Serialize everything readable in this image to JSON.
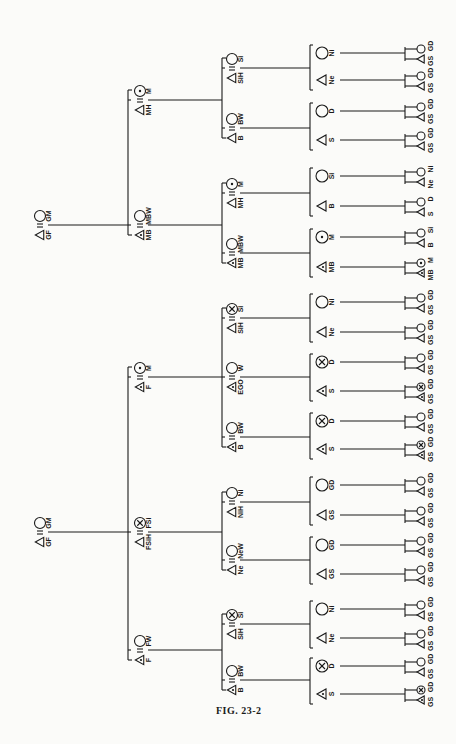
{
  "figure": {
    "caption": "FIG. 23-2",
    "orientation": "rotated 90° (generations run left to right, labels read bottom-to-top)"
  },
  "symbols": {
    "male": "triangle",
    "female": "circle",
    "marriage": "double-line (=)",
    "ego_related_marked": "circle/triangle with dot",
    "crossed": "circle with x"
  },
  "tree": {
    "level0": [
      {
        "id": "top-grandparents",
        "male": "GF",
        "female": "GM",
        "y": 225
      },
      {
        "id": "bottom-grandparents",
        "male": "GF",
        "female": "GM",
        "y": 532
      }
    ],
    "level1": [
      {
        "male": "MH",
        "female": "M",
        "female_mark": "dot",
        "y": 100
      },
      {
        "male": "MB",
        "female": "MBW",
        "male_mark": "dot",
        "y": 225
      },
      {
        "male": "F",
        "female": "M",
        "female_mark": "dot",
        "male_mark": "dot",
        "y": 377
      },
      {
        "male": "FSiH",
        "female": "FSi",
        "female_mark": "x",
        "y": 532
      },
      {
        "male": "F",
        "female": "FW",
        "male_mark": "dot",
        "y": 650
      }
    ],
    "level2": [
      {
        "male": "SiH",
        "female": "Si",
        "y": 68
      },
      {
        "male": "B",
        "female": "BW",
        "y": 128
      },
      {
        "male": "MH",
        "female": "M",
        "female_mark": "dot",
        "y": 193
      },
      {
        "male": "MB",
        "female": "MBW",
        "male_mark": "dot",
        "y": 253
      },
      {
        "male": "SiH",
        "female": "Si",
        "female_mark": "x",
        "y": 318
      },
      {
        "male": "EGO",
        "female": "W",
        "male_mark": "dot",
        "y": 377
      },
      {
        "male": "B",
        "female": "BW",
        "male_mark": "dot",
        "y": 437
      },
      {
        "male": "NiH",
        "female": "Ni",
        "y": 502
      },
      {
        "male": "Ne",
        "female": "NeW",
        "y": 560
      },
      {
        "male": "SiH",
        "female": "Si",
        "female_mark": "x",
        "y": 624
      },
      {
        "male": "B",
        "female": "BW",
        "male_mark": "dot",
        "y": 680
      }
    ],
    "level3": [
      {
        "label": "Ni",
        "sex": "female",
        "y": 53
      },
      {
        "label": "Ne",
        "sex": "male",
        "y": 80
      },
      {
        "label": "D",
        "sex": "female",
        "y": 111
      },
      {
        "label": "S",
        "sex": "male",
        "y": 140
      },
      {
        "label": "Si",
        "sex": "female",
        "y": 176
      },
      {
        "label": "B",
        "sex": "male",
        "y": 206
      },
      {
        "label": "M",
        "sex": "female",
        "mark": "dot",
        "y": 237
      },
      {
        "label": "MB",
        "sex": "male",
        "mark": "dot",
        "y": 267
      },
      {
        "label": "Ni",
        "sex": "female",
        "y": 302
      },
      {
        "label": "Ne",
        "sex": "male",
        "y": 332
      },
      {
        "label": "D",
        "sex": "female",
        "mark": "x",
        "y": 362
      },
      {
        "label": "S",
        "sex": "male",
        "mark": "dot",
        "y": 391
      },
      {
        "label": "D",
        "sex": "female",
        "mark": "x",
        "y": 421
      },
      {
        "label": "S",
        "sex": "male",
        "mark": "dot",
        "y": 449
      },
      {
        "label": "GD",
        "sex": "female",
        "y": 485
      },
      {
        "label": "GS",
        "sex": "male",
        "y": 515
      },
      {
        "label": "GD",
        "sex": "female",
        "y": 545
      },
      {
        "label": "GS",
        "sex": "male",
        "y": 574
      },
      {
        "label": "Ni",
        "sex": "female",
        "y": 609
      },
      {
        "label": "Ne",
        "sex": "male",
        "y": 638
      },
      {
        "label": "D",
        "sex": "female",
        "mark": "x",
        "y": 666
      },
      {
        "label": "S",
        "sex": "male",
        "mark": "dot",
        "y": 694
      }
    ],
    "level4": [
      {
        "male": "GS",
        "female": "GD",
        "y": 53
      },
      {
        "male": "GS",
        "female": "GD",
        "y": 80
      },
      {
        "male": "GS",
        "female": "GD",
        "y": 111
      },
      {
        "male": "GS",
        "female": "GD",
        "y": 140
      },
      {
        "male": "Ne",
        "female": "Ni",
        "y": 176
      },
      {
        "male": "S",
        "female": "D",
        "y": 206
      },
      {
        "male": "B",
        "female": "Si",
        "y": 237
      },
      {
        "male": "MB",
        "female": "M",
        "male_mark": "dot",
        "female_mark": "dot",
        "y": 267
      },
      {
        "male": "GS",
        "female": "GD",
        "y": 302
      },
      {
        "male": "GS",
        "female": "GD",
        "y": 332
      },
      {
        "male": "GS",
        "female": "GD",
        "y": 362
      },
      {
        "male": "GS",
        "female": "GD",
        "male_mark": "dot",
        "female_mark": "x",
        "y": 391
      },
      {
        "male": "GS",
        "female": "GD",
        "y": 421
      },
      {
        "male": "GS",
        "female": "GD",
        "male_mark": "dot",
        "female_mark": "x",
        "y": 449
      },
      {
        "male": "GS",
        "female": "GD",
        "y": 485
      },
      {
        "male": "GS",
        "female": "GD",
        "y": 515
      },
      {
        "male": "GS",
        "female": "GD",
        "y": 545
      },
      {
        "male": "GS",
        "female": "GD",
        "y": 574
      },
      {
        "male": "GS",
        "female": "GD",
        "y": 609
      },
      {
        "male": "GS",
        "female": "GD",
        "y": 638
      },
      {
        "male": "GS",
        "female": "GD",
        "y": 666
      },
      {
        "male": "GS",
        "female": "GD",
        "male_mark": "dot",
        "female_mark": "x",
        "y": 694
      }
    ]
  },
  "connections": {
    "level0_to_level1": [
      {
        "from": 0,
        "children": [
          0,
          1
        ]
      },
      {
        "from": 1,
        "children": [
          2,
          3,
          4
        ]
      }
    ],
    "level1_to_level2": [
      {
        "from": 0,
        "children": [
          0,
          1
        ]
      },
      {
        "from": 1,
        "children": [
          2,
          3
        ]
      },
      {
        "from": 2,
        "children": [
          4,
          5,
          6
        ]
      },
      {
        "from": 3,
        "children": [
          7,
          8
        ]
      },
      {
        "from": 4,
        "children": [
          9,
          10
        ]
      }
    ],
    "level2_to_level3": [
      {
        "from": 0,
        "children": [
          0,
          1
        ]
      },
      {
        "from": 1,
        "children": [
          2,
          3
        ]
      },
      {
        "from": 2,
        "children": [
          4,
          5
        ]
      },
      {
        "from": 3,
        "children": [
          6,
          7
        ]
      },
      {
        "from": 4,
        "children": [
          8,
          9
        ]
      },
      {
        "from": 5,
        "children": [
          10,
          11
        ]
      },
      {
        "from": 6,
        "children": [
          12,
          13
        ]
      },
      {
        "from": 7,
        "children": [
          14,
          15
        ]
      },
      {
        "from": 8,
        "children": [
          16,
          17
        ]
      },
      {
        "from": 9,
        "children": [
          18,
          19
        ]
      },
      {
        "from": 10,
        "children": [
          20,
          21
        ]
      }
    ]
  },
  "layout": {
    "x0": 40,
    "x1": 140,
    "x2": 232,
    "x3": 322,
    "x4": 413,
    "bar1": 128,
    "bar2": 222,
    "bar3": 310,
    "bar4": 405
  }
}
